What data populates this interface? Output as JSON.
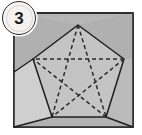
{
  "figure": {
    "step_badge": {
      "label": "3",
      "shape": "circle"
    },
    "colors": {
      "paper_outer": "#b5b5b5",
      "paper_inner": "#c4c4c4",
      "flap_left": "#cfcfcf",
      "flap_right": "#bdbdbd",
      "flap_bottom": "#b0b0b0",
      "corner_fill": "#adadad",
      "stroke": "#1f1f1f",
      "dash": "#2a2a2a",
      "badge_fill": "#f4f3f1",
      "badge_text": "#1a1a1a",
      "page_background": "#ffffff"
    },
    "square": {
      "label": "paper-sheet",
      "left": 14,
      "top": 13,
      "right": 133,
      "bottom": 127
    },
    "pentagon": {
      "label": "pentagon-outline",
      "vertices": [
        {
          "name": "apex",
          "x": 78,
          "y": 25
        },
        {
          "name": "right-upper",
          "x": 124,
          "y": 59
        },
        {
          "name": "right-lower",
          "x": 106,
          "y": 117
        },
        {
          "name": "left-lower",
          "x": 52,
          "y": 117
        },
        {
          "name": "left-upper",
          "x": 33,
          "y": 59
        }
      ]
    },
    "pentagram": {
      "label": "dashed-star",
      "style": "dashed",
      "chords": [
        [
          0,
          2
        ],
        [
          0,
          3
        ],
        [
          1,
          3
        ],
        [
          1,
          4
        ],
        [
          2,
          4
        ]
      ]
    },
    "fold_lines": [
      {
        "name": "fold-left-lower",
        "from": [
          52,
          117
        ],
        "to": [
          14,
          127
        ]
      },
      {
        "name": "fold-right-lower",
        "from": [
          106,
          117
        ],
        "to": [
          133,
          127
        ]
      },
      {
        "name": "fold-left-upper",
        "from": [
          33,
          59
        ],
        "to": [
          14,
          72
        ]
      }
    ]
  }
}
